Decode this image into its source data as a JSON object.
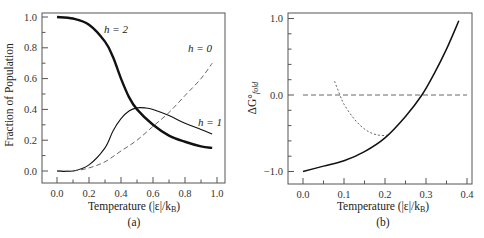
{
  "chart_data": [
    {
      "type": "line",
      "panel_label": "(a)",
      "xlabel": "Temperature (|ε|/k_B)",
      "ylabel": "Fraction of Population",
      "xlim": [
        -0.1,
        1.05
      ],
      "ylim": [
        -0.08,
        1.03
      ],
      "xticks": [
        "0.0",
        "0.2",
        "0.4",
        "0.6",
        "0.8",
        "1.0"
      ],
      "yticks": [
        "0.0",
        "0.2",
        "0.4",
        "0.6",
        "0.8",
        "1.0"
      ],
      "grid": false,
      "series": [
        {
          "name": "h = 2",
          "style": "thick-solid",
          "x": [
            0.0,
            0.1,
            0.2,
            0.3,
            0.35,
            0.4,
            0.45,
            0.5,
            0.6,
            0.7,
            0.8,
            0.9,
            0.97
          ],
          "values": [
            1.0,
            0.99,
            0.95,
            0.84,
            0.74,
            0.6,
            0.48,
            0.4,
            0.3,
            0.23,
            0.19,
            0.16,
            0.15
          ]
        },
        {
          "name": "h = 1",
          "style": "thin-solid",
          "x": [
            0.0,
            0.1,
            0.2,
            0.3,
            0.35,
            0.4,
            0.45,
            0.5,
            0.55,
            0.6,
            0.7,
            0.8,
            0.9,
            0.97
          ],
          "values": [
            0.0,
            0.0,
            0.04,
            0.15,
            0.26,
            0.34,
            0.39,
            0.41,
            0.41,
            0.4,
            0.36,
            0.31,
            0.27,
            0.24
          ]
        },
        {
          "name": "h = 0",
          "style": "dashed",
          "x": [
            0.0,
            0.1,
            0.2,
            0.3,
            0.4,
            0.5,
            0.6,
            0.7,
            0.8,
            0.9,
            0.97
          ],
          "values": [
            0.0,
            0.0,
            0.02,
            0.06,
            0.13,
            0.2,
            0.29,
            0.38,
            0.49,
            0.6,
            0.7
          ]
        }
      ],
      "annotations": [
        {
          "text": "h = 2",
          "x": 0.4,
          "y": 0.93
        },
        {
          "text": "h = 0",
          "x": 0.86,
          "y": 0.77
        },
        {
          "text": "h = 1",
          "x": 0.93,
          "y": 0.3
        }
      ]
    },
    {
      "type": "line",
      "panel_label": "(b)",
      "xlabel": "Temperature (|ε|/k_B)",
      "ylabel": "ΔG°_fold",
      "xlim": [
        -0.04,
        0.41
      ],
      "ylim": [
        -1.15,
        1.05
      ],
      "xticks": [
        "0.0",
        "0.1",
        "0.2",
        "0.3",
        "0.4"
      ],
      "yticks": [
        "−1.0",
        "0.0",
        "1.0"
      ],
      "grid": false,
      "series": [
        {
          "name": "ΔG fold",
          "style": "solid",
          "x": [
            0.0,
            0.05,
            0.1,
            0.15,
            0.2,
            0.25,
            0.29,
            0.32,
            0.35,
            0.38
          ],
          "values": [
            -1.0,
            -0.93,
            -0.86,
            -0.74,
            -0.56,
            -0.28,
            0.0,
            0.28,
            0.6,
            0.97
          ]
        },
        {
          "name": "zero line",
          "style": "dashed",
          "x": [
            0.0,
            0.4
          ],
          "values": [
            0.0,
            0.0
          ]
        },
        {
          "name": "low-T approximation",
          "style": "dotted",
          "x": [
            0.077,
            0.09,
            0.1,
            0.12,
            0.14,
            0.16,
            0.18,
            0.2,
            0.205
          ],
          "values": [
            0.18,
            0.0,
            -0.12,
            -0.28,
            -0.4,
            -0.48,
            -0.52,
            -0.53,
            -0.52
          ]
        }
      ]
    }
  ],
  "labels": {
    "a_panel": "(a)",
    "b_panel": "(b)",
    "a_xlabel": "Temperature (|ε|/k",
    "b_xlabel": "Temperature (|ε|/k",
    "kb_sub": "B",
    "a_ylabel": "Fraction of Population",
    "b_ylabel_main": "ΔG°",
    "b_ylabel_sub": "fold",
    "h2": "h = 2",
    "h0": "h = 0",
    "h1": "h = 1"
  }
}
